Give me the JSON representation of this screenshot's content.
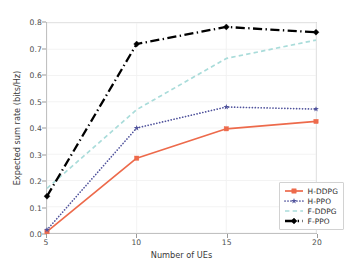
{
  "chart_data": {
    "type": "line",
    "title": "",
    "xlabel": "Number of UEs",
    "ylabel": "Expected sum rate (bits/Hz)",
    "x": [
      5,
      10,
      15,
      20
    ],
    "xtick_labels": [
      "5",
      "10",
      "15",
      "20"
    ],
    "ytick_labels": [
      "0.0",
      "0.1",
      "0.2",
      "0.3",
      "0.4",
      "0.5",
      "0.6",
      "0.7",
      "0.8"
    ],
    "yticks": [
      0.0,
      0.1,
      0.2,
      0.3,
      0.4,
      0.5,
      0.6,
      0.7,
      0.8
    ],
    "xlim": [
      5,
      20
    ],
    "ylim": [
      0.0,
      0.8
    ],
    "grid": true,
    "legend_position": "lower right",
    "series": [
      {
        "name": "H-DDPG",
        "values": [
          0.005,
          0.285,
          0.397,
          0.425
        ],
        "color": "#ED6A4B",
        "linestyle": "solid",
        "marker": "square"
      },
      {
        "name": "H-PPO",
        "values": [
          0.012,
          0.4,
          0.48,
          0.472
        ],
        "color": "#50539C",
        "linestyle": "dotted",
        "marker": "star"
      },
      {
        "name": "F-DDPG",
        "values": [
          0.17,
          0.47,
          0.665,
          0.735
        ],
        "color": "#A9DCDA",
        "linestyle": "dashed",
        "marker": "none"
      },
      {
        "name": "F-PPO",
        "values": [
          0.14,
          0.72,
          0.785,
          0.765
        ],
        "color": "#000000",
        "linestyle": "dashdot",
        "marker": "diamond"
      }
    ]
  },
  "legend": {
    "entries": [
      "H-DDPG",
      "H-PPO",
      "F-DDPG",
      "F-PPO"
    ]
  }
}
